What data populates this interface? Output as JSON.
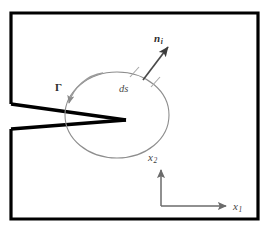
{
  "figure": {
    "type": "technical-line-diagram",
    "canvas": {
      "width": 268,
      "height": 231,
      "background": "#ffffff"
    },
    "colors": {
      "body_outline": "#000000",
      "crack_flanks": "#000000",
      "contour": "#8a8a8a",
      "normal_vector": "#4a4a4a",
      "gamma_pointer": "#8a8a8a",
      "axes": "#6b6b6b",
      "label_text": "#3a3a3a",
      "background": "#ffffff"
    }
  },
  "labels": {
    "normal_vector": {
      "base": "n",
      "sub": "i",
      "full": "n_i"
    },
    "arc_element": {
      "base": "ds",
      "sub": "",
      "full": "ds"
    },
    "contour": {
      "base": "Γ",
      "sub": "",
      "full": "Γ"
    },
    "axis_vertical": {
      "base": "x",
      "sub": "2",
      "full": "x_2"
    },
    "axis_horizontal": {
      "base": "x",
      "sub": "1",
      "full": "x_1"
    }
  },
  "geometry": {
    "body_rect": {
      "x": 11,
      "y": 13,
      "width": 247,
      "height": 206,
      "stroke_width": 3
    },
    "crack": {
      "mouth_upper_y": 104,
      "mouth_lower_y": 129,
      "mouth_x": 11,
      "tip_x": 126,
      "tip_y": 120,
      "upper_flank": "from (11,104) to (126,120)",
      "lower_flank": "from (11,129) to (126,120)"
    },
    "contour_ellipse": {
      "cx": 117,
      "cy": 115,
      "rx": 52,
      "ry": 43
    },
    "normal_arrow": {
      "x1": 144,
      "y1": 78,
      "x2": 170,
      "y2": 44
    },
    "ds_ticks": [
      {
        "x1": 131,
        "y1": 76,
        "x2": 139,
        "y2": 68
      },
      {
        "x1": 152,
        "y1": 86,
        "x2": 160,
        "y2": 77
      }
    ],
    "gamma_pointer": {
      "from_x": 100,
      "from_y": 74,
      "to_x": 70,
      "to_y": 108
    },
    "axes": {
      "origin_x": 161,
      "origin_y": 206,
      "vertical_top_y": 166,
      "horizontal_right_x": 230
    }
  }
}
